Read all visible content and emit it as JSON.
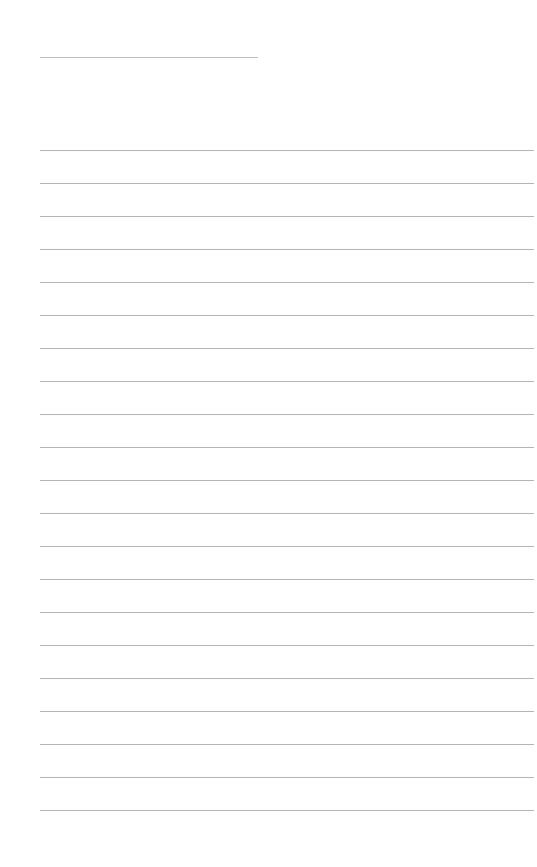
{
  "document": {
    "type": "ruled-sheet",
    "header_rule": {
      "x": 40,
      "y": 57,
      "width": 218
    },
    "body_rules": {
      "x": 40,
      "width": 494,
      "first_y": 150,
      "spacing": 33,
      "count": 21
    },
    "colors": {
      "paper": "#ffffff",
      "rule": "#b4b4b4"
    }
  }
}
